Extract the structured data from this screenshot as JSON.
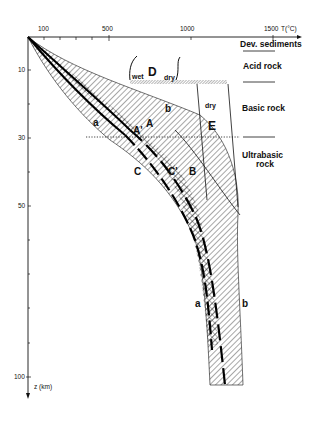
{
  "diagram": {
    "x_axis": {
      "label": "T(°C)",
      "ticks": [
        {
          "label": "100",
          "value": 100
        },
        {
          "label": "500",
          "value": 500
        },
        {
          "label": "1000",
          "value": 1000
        },
        {
          "label": "1500",
          "value": 1500
        }
      ]
    },
    "y_axis": {
      "label": "z (km)",
      "ticks": [
        {
          "label": "10",
          "value": 10
        },
        {
          "label": "30",
          "value": 30
        },
        {
          "label": "50",
          "value": 50
        },
        {
          "label": "100",
          "value": 100
        }
      ]
    },
    "rock_layers": [
      {
        "label": "Dev. sediments"
      },
      {
        "label": "Acid rock"
      },
      {
        "label": "Basic rock"
      },
      {
        "label": "Ultrabasic rock",
        "line1": "Ultrabasic",
        "line2": "rock"
      }
    ],
    "regions": {
      "D": {
        "label": "D",
        "left": "wet",
        "right": "dry"
      },
      "E": {
        "label": "E",
        "top": "dry"
      }
    },
    "curve_labels": {
      "a_upper": "a",
      "b_upper": "b",
      "a_lower": "a",
      "b_lower": "b",
      "A": "A",
      "A_prime": "A'",
      "B": "B",
      "C": "C",
      "C_prime": "C'"
    }
  }
}
